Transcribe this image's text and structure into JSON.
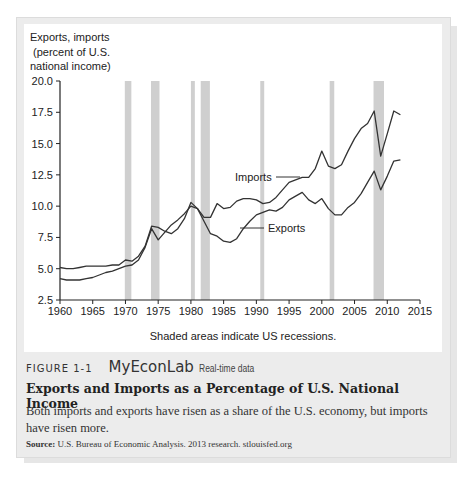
{
  "figure": {
    "number_label": "FIGURE 1-1",
    "brand": "MyEconLab",
    "brand_sub": "Real-time data",
    "title": "Exports and Imports as a Percentage of U.S. National Income",
    "description": "Both imports and exports have risen as a share of the U.S. economy, but imports have risen more.",
    "source_label": "Source:",
    "source_text": "U.S. Bureau of Economic Analysis. 2013 research. stlouisfed.org"
  },
  "chart_data": {
    "type": "line",
    "title": "",
    "ylabel": "Exports, imports (percent of U.S. national income)",
    "ylabel_lines": [
      "Exports, imports",
      "(percent of U.S.",
      "national income)"
    ],
    "xlabel": "",
    "note": "Shaded areas indicate US recessions.",
    "xlim": [
      1960,
      2015
    ],
    "ylim": [
      2.5,
      20.0
    ],
    "x_ticks": [
      "1960",
      "1965",
      "1970",
      "1975",
      "1980",
      "1985",
      "1990",
      "1995",
      "2000",
      "2005",
      "2010",
      "2015"
    ],
    "y_ticks": [
      "2.5",
      "5.0",
      "7.5",
      "10.0",
      "12.5",
      "15.0",
      "17.5",
      "20.0"
    ],
    "grid": false,
    "legend": "inline labels",
    "recessions": [
      [
        1969.9,
        1970.9
      ],
      [
        1973.9,
        1975.2
      ],
      [
        1980.0,
        1980.6
      ],
      [
        1981.5,
        1982.9
      ],
      [
        1990.6,
        1991.2
      ],
      [
        2001.2,
        2001.9
      ],
      [
        2007.9,
        2009.5
      ]
    ],
    "x": [
      1960,
      1961,
      1962,
      1963,
      1964,
      1965,
      1966,
      1967,
      1968,
      1969,
      1970,
      1971,
      1972,
      1973,
      1974,
      1975,
      1976,
      1977,
      1978,
      1979,
      1980,
      1981,
      1982,
      1983,
      1984,
      1985,
      1986,
      1987,
      1988,
      1989,
      1990,
      1991,
      1992,
      1993,
      1994,
      1995,
      1996,
      1997,
      1998,
      1999,
      2000,
      2001,
      2002,
      2003,
      2004,
      2005,
      2006,
      2007,
      2008,
      2009,
      2010,
      2011,
      2012
    ],
    "series": [
      {
        "name": "Imports",
        "values": [
          5.1,
          5.0,
          5.0,
          5.1,
          5.2,
          5.2,
          5.2,
          5.2,
          5.3,
          5.3,
          5.7,
          5.6,
          6.0,
          6.8,
          8.4,
          8.3,
          8.0,
          7.8,
          8.2,
          9.0,
          10.3,
          9.8,
          9.1,
          9.1,
          10.2,
          9.8,
          9.9,
          10.4,
          10.6,
          10.6,
          10.5,
          10.2,
          10.3,
          10.7,
          11.3,
          11.9,
          12.1,
          12.3,
          12.3,
          13.0,
          14.4,
          13.2,
          13.0,
          13.3,
          14.4,
          15.4,
          16.2,
          16.6,
          17.6,
          14.0,
          15.8,
          17.6,
          17.3
        ]
      },
      {
        "name": "Exports",
        "values": [
          4.2,
          4.1,
          4.1,
          4.1,
          4.2,
          4.3,
          4.5,
          4.7,
          4.8,
          5.0,
          5.2,
          5.3,
          5.7,
          6.7,
          8.2,
          7.3,
          7.9,
          8.5,
          8.9,
          9.4,
          10.0,
          9.8,
          8.8,
          7.8,
          7.6,
          7.2,
          7.1,
          7.4,
          8.2,
          8.8,
          9.3,
          9.5,
          9.7,
          9.6,
          9.9,
          10.5,
          10.8,
          11.1,
          10.5,
          10.2,
          10.6,
          9.8,
          9.3,
          9.3,
          9.9,
          10.3,
          11.0,
          11.9,
          12.8,
          11.3,
          12.4,
          13.6,
          13.7
        ]
      }
    ],
    "line_color": "#333333",
    "recession_color": "#cfcfcf"
  }
}
